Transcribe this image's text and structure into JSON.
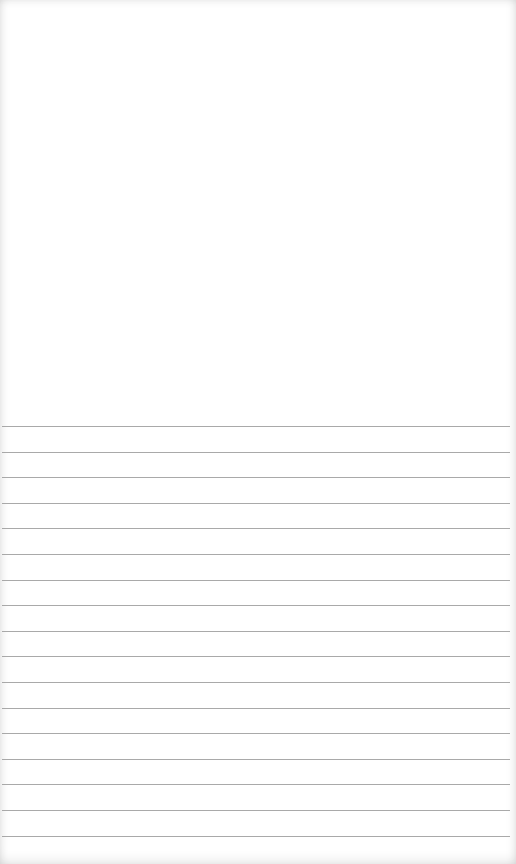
{
  "page": {
    "type": "lined-paper",
    "background_color": "#ffffff",
    "line_color": "#9a9a9a",
    "top_blank_height_px": 420,
    "ruled_lines": {
      "count": 17,
      "first_line_y": 426,
      "spacing_px": 25.6
    }
  }
}
